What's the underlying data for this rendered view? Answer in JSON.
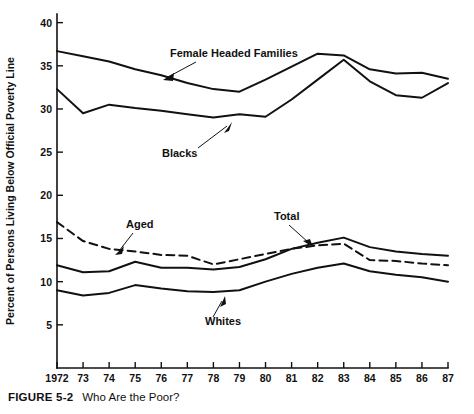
{
  "figure": {
    "caption_number": "FIGURE 5-2",
    "caption_text": "Who Are the Poor?"
  },
  "chart_data": {
    "type": "line",
    "title": "",
    "xlabel": "",
    "ylabel": "Percent of Persons Living Below Official Poverty Line",
    "x": [
      1972,
      1973,
      1974,
      1975,
      1976,
      1977,
      1978,
      1979,
      1980,
      1981,
      1982,
      1983,
      1984,
      1985,
      1986,
      1987
    ],
    "xtick_labels": [
      "1972",
      "73",
      "74",
      "75",
      "76",
      "77",
      "78",
      "79",
      "80",
      "81",
      "82",
      "83",
      "84",
      "85",
      "86",
      "87"
    ],
    "ytick_labels": [
      "5",
      "10",
      "15",
      "20",
      "25",
      "30",
      "35",
      "40"
    ],
    "ytick_values": [
      5,
      10,
      15,
      20,
      25,
      30,
      35,
      40
    ],
    "ylim": [
      0,
      41
    ],
    "xlim": [
      1972,
      1987
    ],
    "grid": false,
    "legend": "inline-annotations",
    "series": [
      {
        "name": "Female Headed Families",
        "style": "solid",
        "values": [
          36.7,
          36.1,
          35.5,
          34.6,
          33.9,
          33.0,
          32.3,
          32.0,
          33.4,
          34.9,
          36.4,
          36.2,
          34.6,
          34.1,
          34.2,
          33.5
        ]
      },
      {
        "name": "Blacks",
        "style": "solid",
        "values": [
          32.3,
          29.5,
          30.5,
          30.1,
          29.8,
          29.4,
          29.0,
          29.4,
          29.1,
          31.1,
          33.4,
          35.7,
          33.2,
          31.6,
          31.3,
          33.0
        ]
      },
      {
        "name": "Aged",
        "style": "dashed",
        "values": [
          16.9,
          14.7,
          13.8,
          13.5,
          13.1,
          13.0,
          12.0,
          12.6,
          13.2,
          13.8,
          14.2,
          14.4,
          12.5,
          12.4,
          12.1,
          11.9
        ]
      },
      {
        "name": "Total",
        "style": "solid",
        "values": [
          11.9,
          11.1,
          11.2,
          12.3,
          11.6,
          11.6,
          11.4,
          11.7,
          12.6,
          13.8,
          14.5,
          15.1,
          14.0,
          13.5,
          13.2,
          13.0
        ]
      },
      {
        "name": "Whites",
        "style": "solid",
        "values": [
          9.0,
          8.4,
          8.7,
          9.6,
          9.2,
          8.9,
          8.8,
          9.0,
          10.0,
          10.9,
          11.6,
          12.1,
          11.2,
          10.8,
          10.5,
          10.0
        ]
      }
    ],
    "annotations": [
      {
        "label": "Female Headed Families",
        "points_to_series": "Female Headed Families"
      },
      {
        "label": "Blacks",
        "points_to_series": "Blacks"
      },
      {
        "label": "Aged",
        "points_to_series": "Aged"
      },
      {
        "label": "Total",
        "points_to_series": "Total"
      },
      {
        "label": "Whites",
        "points_to_series": "Whites"
      }
    ]
  },
  "colors": {
    "ink": "#111111",
    "background": "#ffffff"
  }
}
